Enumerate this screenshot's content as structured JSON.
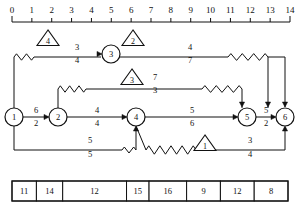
{
  "diagram": {
    "axis": {
      "name": "time-ruler",
      "min": 0,
      "max": 14,
      "ticks": [
        0,
        1,
        2,
        3,
        4,
        5,
        6,
        7,
        8,
        9,
        10,
        11,
        12,
        13,
        14
      ],
      "tick_labels": [
        "0",
        "1",
        "2",
        "3",
        "4",
        "5",
        "6",
        "7",
        "8",
        "9",
        "10",
        "11",
        "12",
        "13",
        "14"
      ],
      "y": 22,
      "x_start": 12,
      "x_end": 290
    },
    "nodes": [
      {
        "id": "n1",
        "label": "1",
        "x": 14,
        "y": 117,
        "r": 9
      },
      {
        "id": "n2",
        "label": "2",
        "x": 58,
        "y": 117,
        "r": 9
      },
      {
        "id": "n3",
        "label": "3",
        "x": 111,
        "y": 54,
        "r": 9
      },
      {
        "id": "n4",
        "label": "4",
        "x": 136,
        "y": 117,
        "r": 9
      },
      {
        "id": "n5",
        "label": "5",
        "x": 247,
        "y": 117,
        "r": 9
      },
      {
        "id": "n6",
        "label": "6",
        "x": 285,
        "y": 117,
        "r": 9
      }
    ],
    "float_triangles": [
      {
        "id": "t4",
        "label": "4",
        "x": 48,
        "y": 40
      },
      {
        "id": "t2",
        "label": "2",
        "x": 133,
        "y": 40
      },
      {
        "id": "t3",
        "label": "3",
        "x": 132,
        "y": 79
      },
      {
        "id": "t1",
        "label": "1",
        "x": 205,
        "y": 145
      }
    ],
    "edge_labels": [
      {
        "id": "e-1-2-above",
        "text": "6",
        "x": 36,
        "y": 113
      },
      {
        "id": "e-1-2-below",
        "text": "2",
        "x": 36,
        "y": 126
      },
      {
        "id": "e-2-4-above",
        "text": "4",
        "x": 97,
        "y": 113
      },
      {
        "id": "e-2-4-below",
        "text": "4",
        "x": 97,
        "y": 126
      },
      {
        "id": "e-4-5-above",
        "text": "5",
        "x": 192,
        "y": 113
      },
      {
        "id": "e-4-5-below",
        "text": "6",
        "x": 192,
        "y": 126
      },
      {
        "id": "e-5-6-above",
        "text": "5",
        "x": 266,
        "y": 113
      },
      {
        "id": "e-5-6-below",
        "text": "2",
        "x": 266,
        "y": 126
      },
      {
        "id": "e-top-left-above",
        "text": "3",
        "x": 77,
        "y": 50
      },
      {
        "id": "e-top-left-below",
        "text": "4",
        "x": 77,
        "y": 63
      },
      {
        "id": "e-top-right-above",
        "text": "4",
        "x": 190,
        "y": 50
      },
      {
        "id": "e-top-right-below",
        "text": "7",
        "x": 190,
        "y": 63
      },
      {
        "id": "e-mid-above",
        "text": "7",
        "x": 155,
        "y": 80
      },
      {
        "id": "e-mid-below",
        "text": "3",
        "x": 155,
        "y": 93
      },
      {
        "id": "e-bottom-left-above",
        "text": "5",
        "x": 90,
        "y": 143
      },
      {
        "id": "e-bottom-left-below",
        "text": "5",
        "x": 90,
        "y": 157
      },
      {
        "id": "e-bottom-right-above",
        "text": "3",
        "x": 250,
        "y": 143
      },
      {
        "id": "e-bottom-right-below",
        "text": "4",
        "x": 250,
        "y": 157
      }
    ],
    "table": {
      "name": "duration-bar-row",
      "x": 12,
      "y": 181,
      "width": 276,
      "height": 20,
      "cells": [
        {
          "label": "11",
          "width": 26
        },
        {
          "label": "14",
          "width": 28
        },
        {
          "label": "12",
          "width": 68
        },
        {
          "label": "15",
          "width": 24
        },
        {
          "label": "16",
          "width": 40
        },
        {
          "label": "9",
          "width": 36
        },
        {
          "label": "12",
          "width": 36
        },
        {
          "label": "8",
          "width": 36
        }
      ]
    }
  }
}
